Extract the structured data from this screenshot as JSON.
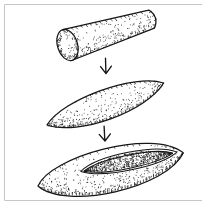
{
  "figure": {
    "colors": {
      "paper": "#ffffff",
      "ink": "#161616",
      "frame": "#c6c6c6"
    },
    "stages": [
      {
        "icon": "log-cylinder-illustration"
      },
      {
        "icon": "shaped-ellipsoid-illustration"
      },
      {
        "icon": "hollowed-trough-illustration"
      }
    ],
    "arrows": [
      {
        "icon": "down-arrow-icon"
      },
      {
        "icon": "down-arrow-icon"
      }
    ]
  }
}
